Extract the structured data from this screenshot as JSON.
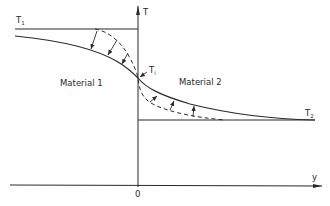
{
  "diagram": {
    "title": "",
    "axes": {
      "vertical_label": "T",
      "horizontal_label": "y",
      "origin_label": "0"
    },
    "levels": {
      "t1": {
        "label": "T",
        "subscript": "1"
      },
      "t2": {
        "label": "T",
        "subscript": "2"
      },
      "ti": {
        "label": "T",
        "subscript": "i"
      }
    },
    "regions": {
      "left": "Material 1",
      "right": "Material 2"
    },
    "curves": {
      "solid": "temperature profile (actual)",
      "dashed": "temperature profile (alternative)",
      "arrows": "displacement arrows between profiles"
    },
    "colors": {
      "line": "#2a2a2a",
      "background": "#ffffff"
    }
  }
}
